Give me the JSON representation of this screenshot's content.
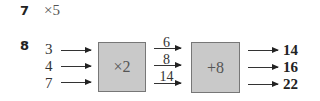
{
  "q7": {
    "number": "7",
    "answer": "×5"
  },
  "q8": {
    "number": "8",
    "inputs": [
      "3",
      "4",
      "7"
    ],
    "machine1": "×2",
    "intermediate": [
      "6",
      "8",
      "14"
    ],
    "machine2": "+8",
    "outputs": [
      "14",
      "16",
      "22"
    ]
  }
}
